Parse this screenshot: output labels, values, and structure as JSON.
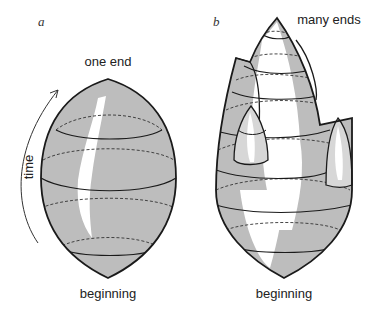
{
  "panels": {
    "a": {
      "letter": "a",
      "top_label": "one end",
      "bottom_label": "beginning",
      "axis_label": "time"
    },
    "b": {
      "letter": "b",
      "top_label": "many ends",
      "bottom_label": "beginning"
    }
  },
  "colors": {
    "fill": "#bdbdbd",
    "highlight": "#ffffff",
    "stroke": "#1a1a1a"
  }
}
